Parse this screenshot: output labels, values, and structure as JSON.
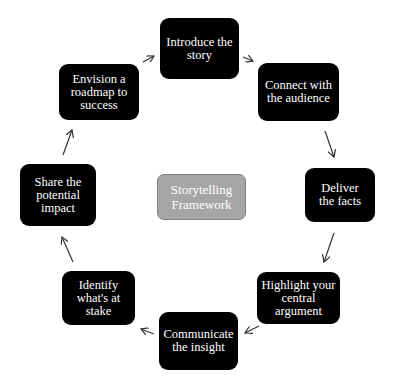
{
  "diagram": {
    "type": "cycle",
    "center": {
      "label": "Storytelling Framework",
      "color": "#a6a6a6"
    },
    "node_color": "#000000",
    "text_color": "#ffffff",
    "nodes": [
      {
        "id": "introduce",
        "label": "Introduce the story"
      },
      {
        "id": "connect",
        "label": "Connect with the audience"
      },
      {
        "id": "deliver",
        "label": "Deliver the facts"
      },
      {
        "id": "highlight",
        "label": "Highlight your central argument"
      },
      {
        "id": "communicate",
        "label": "Communicate the insight"
      },
      {
        "id": "identify",
        "label": "Identify what's at stake"
      },
      {
        "id": "share",
        "label": "Share the potential impact"
      },
      {
        "id": "envision",
        "label": "Envision a roadmap to success"
      }
    ],
    "edges": [
      {
        "from": "introduce",
        "to": "connect"
      },
      {
        "from": "connect",
        "to": "deliver"
      },
      {
        "from": "deliver",
        "to": "highlight"
      },
      {
        "from": "highlight",
        "to": "communicate"
      },
      {
        "from": "communicate",
        "to": "identify"
      },
      {
        "from": "identify",
        "to": "share"
      },
      {
        "from": "share",
        "to": "envision"
      },
      {
        "from": "envision",
        "to": "introduce"
      }
    ]
  }
}
